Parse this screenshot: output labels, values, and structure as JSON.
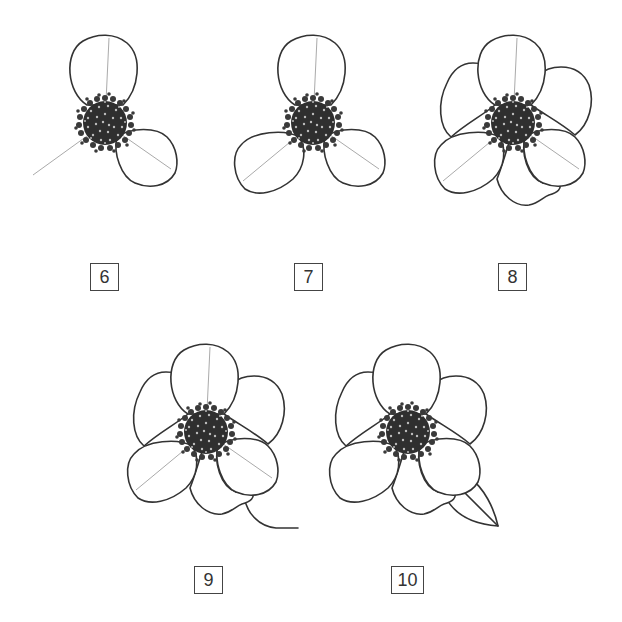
{
  "diagram": {
    "steps": [
      {
        "number": "6",
        "label": "6",
        "description": "Two petals drawn around the stamen cluster with guide lines"
      },
      {
        "number": "7",
        "label": "7",
        "description": "Three front petals complete with guide lines"
      },
      {
        "number": "8",
        "label": "8",
        "description": "Back petals added behind the three front petals"
      },
      {
        "number": "9",
        "label": "9",
        "description": "Flower with stem added"
      },
      {
        "number": "10",
        "label": "10",
        "description": "Guide lines removed and a leaf added"
      }
    ]
  },
  "colors": {
    "outline": "#333333",
    "guide_line": "#aaaaaa",
    "stamen": "#2f2f2f",
    "background": "#ffffff"
  }
}
